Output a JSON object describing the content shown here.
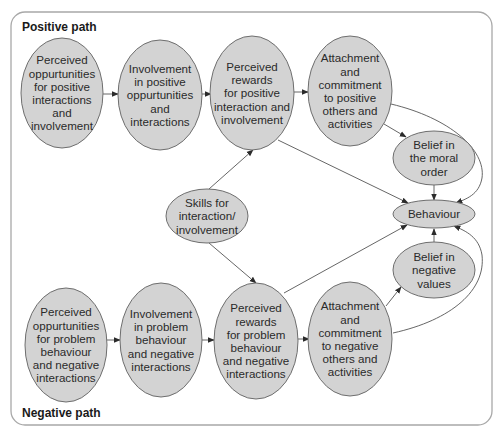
{
  "diagram": {
    "positive_label": "Positive path",
    "negative_label": "Negative path",
    "nodes": {
      "pos_opportunities": {
        "label": "Perceived\noppurtunities\nfor positive\ninteractions\nand\ninvolvement",
        "cx": 62,
        "cy": 93,
        "rx": 41,
        "ry": 55
      },
      "pos_involvement": {
        "label": "Involvement\nin positive\noppurtunities\nand\ninteractions",
        "cx": 160,
        "cy": 95,
        "rx": 42,
        "ry": 55
      },
      "pos_rewards": {
        "label": "Perceived\nrewards\nfor positive\ninteraction and\ninvolvement",
        "cx": 252,
        "cy": 93,
        "rx": 42,
        "ry": 57
      },
      "pos_attachment": {
        "label": "Attachment\nand\ncommitment\nto positive\nothers and\nactivities",
        "cx": 350,
        "cy": 91,
        "rx": 42,
        "ry": 55
      },
      "belief_moral": {
        "label": "Belief in\nthe moral\norder",
        "cx": 434,
        "cy": 158,
        "rx": 41,
        "ry": 27
      },
      "skills": {
        "label": "Skills for\ninteraction/\ninvolvement",
        "cx": 207,
        "cy": 216,
        "rx": 41,
        "ry": 27
      },
      "behaviour": {
        "label": "Behaviour",
        "cx": 434,
        "cy": 214,
        "rx": 41,
        "ry": 14
      },
      "belief_negative": {
        "label": "Belief in\nnegative\nvalues",
        "cx": 434,
        "cy": 270,
        "rx": 41,
        "ry": 28
      },
      "neg_opportunities": {
        "label": "Perceived\noppurtunities\nfor problem\nbehaviour\nand negative\ninteractions",
        "cx": 66,
        "cy": 345,
        "rx": 41,
        "ry": 57
      },
      "neg_involvement": {
        "label": "Involvement\nin problem\nbehaviour\nand negative\ninteractions",
        "cx": 161,
        "cy": 340,
        "rx": 41,
        "ry": 57
      },
      "neg_rewards": {
        "label": "Perceived\nrewards\nfor problem\nbehaviour\nand negative\ninteractions",
        "cx": 256,
        "cy": 341,
        "rx": 42,
        "ry": 58
      },
      "neg_attachment": {
        "label": "Attachment\nand\ncommitment\nto negative\nothers and\nactivities",
        "cx": 350,
        "cy": 339,
        "rx": 42,
        "ry": 57
      }
    },
    "edges": [
      {
        "from": "pos_opportunities",
        "to": "pos_involvement"
      },
      {
        "from": "pos_involvement",
        "to": "pos_rewards"
      },
      {
        "from": "pos_rewards",
        "to": "pos_attachment"
      },
      {
        "from": "pos_attachment",
        "to": "belief_moral"
      },
      {
        "from": "pos_attachment",
        "to": "behaviour",
        "curved": true
      },
      {
        "from": "pos_rewards",
        "to": "behaviour"
      },
      {
        "from": "belief_moral",
        "to": "behaviour"
      },
      {
        "from": "skills",
        "to": "pos_rewards"
      },
      {
        "from": "skills",
        "to": "neg_rewards"
      },
      {
        "from": "neg_opportunities",
        "to": "neg_involvement"
      },
      {
        "from": "neg_involvement",
        "to": "neg_rewards"
      },
      {
        "from": "neg_rewards",
        "to": "neg_attachment"
      },
      {
        "from": "neg_attachment",
        "to": "belief_negative"
      },
      {
        "from": "neg_attachment",
        "to": "behaviour",
        "curved": true
      },
      {
        "from": "neg_rewards",
        "to": "behaviour"
      },
      {
        "from": "belief_negative",
        "to": "behaviour"
      }
    ],
    "colors": {
      "node_fill": "#d3d3d3",
      "node_stroke": "#6e6e6e",
      "edge": "#555555",
      "frame": "#a8a8a8",
      "text": "#2a2a2a"
    }
  }
}
